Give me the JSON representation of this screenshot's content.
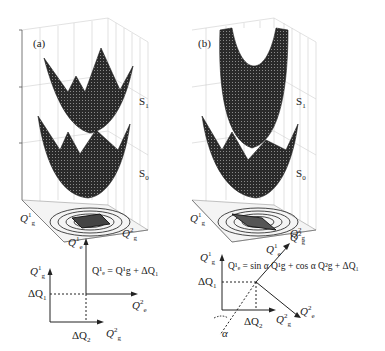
{
  "figure": {
    "panels": [
      {
        "id": "a",
        "tag": "(a)",
        "surfaces": {
          "upper": "S",
          "upper_sub": "1",
          "lower": "S",
          "lower_sub": "0"
        },
        "axes3d": {
          "x_label": "Q",
          "x_sup": "1",
          "x_sub": "g",
          "y_label": "Q",
          "y_sup": "2",
          "y_sub": "g"
        },
        "diagram": {
          "axis_e1": "Q",
          "axis_e1_sup": "1",
          "axis_e1_sub": "e",
          "axis_e2": "Q",
          "axis_e2_sup": "2",
          "axis_e2_sub": "e",
          "axis_g1": "Q",
          "axis_g1_sup": "1",
          "axis_g1_sub": "g",
          "axis_g2": "Q",
          "axis_g2_sup": "2",
          "axis_g2_sub": "g",
          "offset1": "ΔQ",
          "offset1_sub": "1",
          "offset2": "ΔQ",
          "offset2_sub": "2",
          "equation": "Q¹ₑ = Q¹g + ΔQ₁"
        }
      },
      {
        "id": "b",
        "tag": "(b)",
        "surfaces": {
          "upper": "S",
          "upper_sub": "1",
          "lower": "S",
          "lower_sub": "0"
        },
        "axes3d": {
          "x_label": "Q",
          "x_sup": "1",
          "x_sub": "g",
          "y_label": "Q",
          "y_sup": "2",
          "y_sub": "g"
        },
        "diagram": {
          "axis_e1": "Q",
          "axis_e1_sup": "1",
          "axis_e1_sub": "e",
          "axis_e2": "Q",
          "axis_e2_sup": "2",
          "axis_e2_sub": "e",
          "axis_g1": "Q",
          "axis_g1_sup": "1",
          "axis_g1_sub": "g",
          "axis_g2": "Q",
          "axis_g2_sup": "2",
          "axis_g2_sub": "g",
          "offset1": "ΔQ",
          "offset1_sub": "1",
          "offset2": "ΔQ",
          "offset2_sub": "2",
          "angle": "α",
          "equation": "Q¹ₑ = sin α Q¹g + cos α Q²g + ΔQ₁"
        }
      }
    ],
    "colors": {
      "surface": "#2a2a2a",
      "grid": "#c8c8c8",
      "ink": "#222222"
    }
  }
}
